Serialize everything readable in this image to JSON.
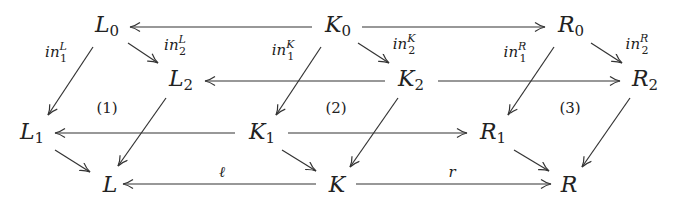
{
  "nodes": {
    "L0": {
      "base": "L",
      "sub": "0"
    },
    "K0": {
      "base": "K",
      "sub": "0"
    },
    "R0": {
      "base": "R",
      "sub": "0"
    },
    "L2": {
      "base": "L",
      "sub": "2"
    },
    "K2": {
      "base": "K",
      "sub": "2"
    },
    "R2": {
      "base": "R",
      "sub": "2"
    },
    "L1": {
      "base": "L",
      "sub": "1"
    },
    "K1": {
      "base": "K",
      "sub": "1"
    },
    "R1": {
      "base": "R",
      "sub": "1"
    },
    "L": {
      "base": "L",
      "sub": ""
    },
    "K": {
      "base": "K",
      "sub": ""
    },
    "R": {
      "base": "R",
      "sub": ""
    }
  },
  "labels": {
    "in1L": {
      "base": "in",
      "sup": "L",
      "sub": "1"
    },
    "in2L": {
      "base": "in",
      "sup": "L",
      "sub": "2"
    },
    "in1K": {
      "base": "in",
      "sup": "K",
      "sub": "1"
    },
    "in2K": {
      "base": "in",
      "sup": "K",
      "sub": "2"
    },
    "in1R": {
      "base": "in",
      "sup": "R",
      "sub": "1"
    },
    "in2R": {
      "base": "in",
      "sup": "R",
      "sub": "2"
    },
    "l": "ℓ",
    "r": "r"
  },
  "regions": [
    "(1)",
    "(2)",
    "(3)"
  ],
  "arrows": [
    {
      "from": "K0",
      "to": "L0"
    },
    {
      "from": "K0",
      "to": "R0"
    },
    {
      "from": "K2",
      "to": "L2"
    },
    {
      "from": "K2",
      "to": "R2"
    },
    {
      "from": "K1",
      "to": "L1"
    },
    {
      "from": "K1",
      "to": "R1"
    },
    {
      "from": "K",
      "to": "L",
      "label": "ℓ"
    },
    {
      "from": "K",
      "to": "R",
      "label": "r"
    },
    {
      "from": "L0",
      "to": "L1",
      "label": "in_1^L"
    },
    {
      "from": "L0",
      "to": "L2",
      "label": "in_2^L"
    },
    {
      "from": "K0",
      "to": "K1",
      "label": "in_1^K"
    },
    {
      "from": "K0",
      "to": "K2",
      "label": "in_2^K"
    },
    {
      "from": "R0",
      "to": "R1",
      "label": "in_1^R"
    },
    {
      "from": "R0",
      "to": "R2",
      "label": "in_2^R"
    },
    {
      "from": "L1",
      "to": "L"
    },
    {
      "from": "L2",
      "to": "L"
    },
    {
      "from": "K1",
      "to": "K"
    },
    {
      "from": "K2",
      "to": "K"
    },
    {
      "from": "R1",
      "to": "R"
    },
    {
      "from": "R2",
      "to": "R"
    }
  ]
}
